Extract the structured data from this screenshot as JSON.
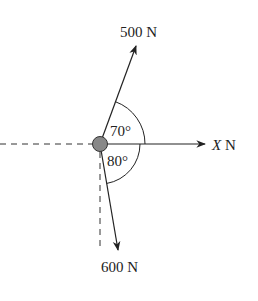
{
  "diagram": {
    "forces": [
      {
        "label": "500 N",
        "angle_from_x_deg": 70,
        "direction": "up-right"
      },
      {
        "label": "X N",
        "italic_part": "X",
        "unit": "N",
        "direction": "positive x"
      },
      {
        "label": "600 N",
        "angle_from_x_deg": -80,
        "direction": "down-right"
      }
    ],
    "angles": [
      {
        "label": "70°"
      },
      {
        "label": "80°"
      }
    ],
    "labels": {
      "force_top": "500 N",
      "force_right_var": "X",
      "force_right_unit": " N",
      "force_bottom": "600 N",
      "angle_top": "70°",
      "angle_bottom": "80°"
    },
    "colors": {
      "line": "#222222",
      "particle": "#888888"
    }
  }
}
